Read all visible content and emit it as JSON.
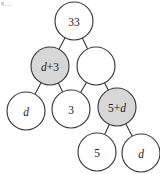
{
  "diagram": {
    "kind": "binary-tree",
    "title": "",
    "colors": {
      "background": "#ffffff",
      "node_stroke": "#3a3a3a",
      "node_fill_default": "#ffffff",
      "node_fill_highlight": "#d7d7d7",
      "edge_stroke": "#3a3a3a",
      "label_color": "#1d1d1d"
    },
    "node_radius": 19,
    "nodes": [
      {
        "id": "root",
        "label": "33",
        "label_parts": [
          {
            "text": "33",
            "italic": false
          }
        ],
        "fill": "white",
        "cx": 74,
        "cy": 21,
        "r": 19
      },
      {
        "id": "l2a",
        "label": "d+3",
        "label_parts": [
          {
            "text": "d",
            "italic": true
          },
          {
            "text": "+3",
            "italic": false
          }
        ],
        "fill": "gray",
        "cx": 50,
        "cy": 66,
        "r": 19
      },
      {
        "id": "l2b",
        "label": "",
        "label_parts": [],
        "fill": "white",
        "cx": 96,
        "cy": 66,
        "r": 19
      },
      {
        "id": "l3a",
        "label": "d",
        "label_parts": [
          {
            "text": "d",
            "italic": true
          }
        ],
        "fill": "white",
        "cx": 26,
        "cy": 111,
        "r": 19
      },
      {
        "id": "l3b",
        "label": "3",
        "label_parts": [
          {
            "text": "3",
            "italic": false
          }
        ],
        "fill": "white",
        "cx": 71,
        "cy": 109,
        "r": 19
      },
      {
        "id": "l3c",
        "label": "5+d",
        "label_parts": [
          {
            "text": "5+",
            "italic": false
          },
          {
            "text": "d",
            "italic": true
          }
        ],
        "fill": "gray",
        "cx": 117,
        "cy": 107,
        "r": 19
      },
      {
        "id": "l4a",
        "label": "5",
        "label_parts": [
          {
            "text": "5",
            "italic": false
          }
        ],
        "fill": "white",
        "cx": 97,
        "cy": 152,
        "r": 19
      },
      {
        "id": "l4b",
        "label": "d",
        "label_parts": [
          {
            "text": "d",
            "italic": true
          }
        ],
        "fill": "white",
        "cx": 141,
        "cy": 153,
        "r": 19
      }
    ],
    "edges": [
      {
        "from": "root",
        "to": "l2a"
      },
      {
        "from": "root",
        "to": "l2b"
      },
      {
        "from": "l2a",
        "to": "l3a"
      },
      {
        "from": "l2a",
        "to": "l3b"
      },
      {
        "from": "l2b",
        "to": "l3b"
      },
      {
        "from": "l2b",
        "to": "l3c"
      },
      {
        "from": "l3c",
        "to": "l4a"
      },
      {
        "from": "l3c",
        "to": "l4b"
      }
    ]
  }
}
